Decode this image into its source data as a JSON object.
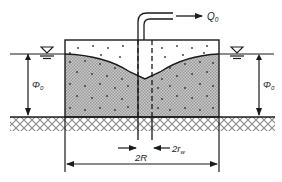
{
  "diagram": {
    "labels": {
      "discharge": "Q",
      "discharge_sub": "0",
      "head_left": "Φ",
      "head_left_sub": "0",
      "head_right": "Φ",
      "head_right_sub": "0",
      "well_diameter": "2r",
      "well_diameter_sub": "w",
      "radius_of_influence": "2R"
    },
    "symbols": {
      "water_table_left": "water-table-triangle",
      "water_table_right": "water-table-triangle"
    },
    "colors": {
      "line": "#1a1a1a",
      "saturated_fill": "#b8b8b8",
      "dots": "#333333",
      "background": "#ffffff"
    }
  }
}
